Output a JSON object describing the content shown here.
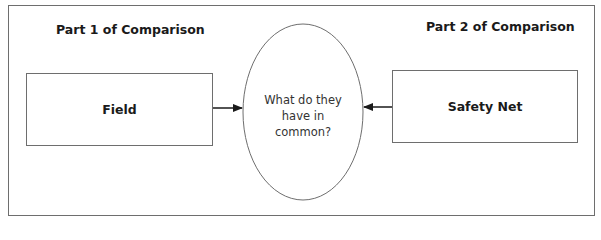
{
  "diagram": {
    "part1": {
      "title": "Part 1 of Comparison",
      "box_label": "Field"
    },
    "part2": {
      "title": "Part 2 of Comparison",
      "box_label": "Safety Net"
    },
    "center": {
      "line1": "What do they",
      "line2": "have in",
      "line3": "common?"
    },
    "colors": {
      "stroke": "#6e6e6e",
      "text": "#1a1a1a",
      "arrow": "#1a1a1a"
    }
  }
}
